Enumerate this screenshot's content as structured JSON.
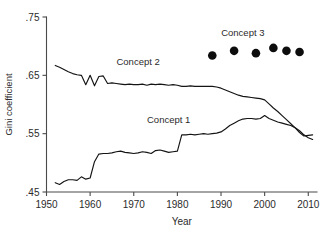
{
  "chart_data": {
    "type": "line",
    "title": "",
    "xlabel": "Year",
    "ylabel": "Gini coefficient",
    "xlim": [
      1950,
      2012
    ],
    "ylim": [
      0.45,
      0.75
    ],
    "grid": false,
    "legend": "inline-annotations",
    "xticks": [
      1950,
      1960,
      1970,
      1980,
      1990,
      2000,
      2010
    ],
    "xtick_labels": [
      "1950",
      "1960",
      "1970",
      "1980",
      "1990",
      "2000",
      "2010"
    ],
    "yticks": [
      0.45,
      0.55,
      0.65,
      0.75
    ],
    "ytick_labels": [
      ".45",
      ".55",
      ".65",
      ".75"
    ],
    "series": [
      {
        "name": "Concept 1",
        "label": "Concept 1",
        "style": "line",
        "color": "#141414",
        "label_x": 1978,
        "label_y": 0.568,
        "x": [
          1952,
          1953,
          1954,
          1955,
          1956,
          1957,
          1958,
          1959,
          1960,
          1961,
          1962,
          1963,
          1964,
          1965,
          1966,
          1967,
          1968,
          1969,
          1970,
          1971,
          1972,
          1973,
          1974,
          1975,
          1976,
          1977,
          1978,
          1979,
          1980,
          1981,
          1982,
          1983,
          1984,
          1985,
          1986,
          1987,
          1988,
          1989,
          1990,
          1991,
          1992,
          1993,
          1994,
          1995,
          1996,
          1997,
          1998,
          1999,
          2000,
          2001,
          2002,
          2003,
          2004,
          2005,
          2006,
          2007,
          2008,
          2009,
          2010,
          2011
        ],
        "y": [
          0.466,
          0.463,
          0.468,
          0.471,
          0.471,
          0.47,
          0.476,
          0.472,
          0.474,
          0.502,
          0.515,
          0.516,
          0.516,
          0.517,
          0.519,
          0.52,
          0.518,
          0.517,
          0.516,
          0.517,
          0.519,
          0.518,
          0.516,
          0.521,
          0.522,
          0.52,
          0.518,
          0.519,
          0.52,
          0.548,
          0.548,
          0.549,
          0.548,
          0.549,
          0.55,
          0.549,
          0.55,
          0.551,
          0.553,
          0.558,
          0.564,
          0.568,
          0.572,
          0.575,
          0.576,
          0.576,
          0.575,
          0.576,
          0.581,
          0.576,
          0.573,
          0.57,
          0.568,
          0.566,
          0.564,
          0.56,
          0.555,
          0.548,
          0.543,
          0.54
        ]
      },
      {
        "name": "Concept 2",
        "label": "Concept 2",
        "style": "line",
        "color": "#141414",
        "label_x": 1971,
        "label_y": 0.667,
        "x": [
          1952,
          1953,
          1954,
          1955,
          1956,
          1957,
          1958,
          1959,
          1960,
          1961,
          1962,
          1963,
          1964,
          1965,
          1966,
          1967,
          1968,
          1969,
          1970,
          1971,
          1972,
          1973,
          1974,
          1975,
          1976,
          1977,
          1978,
          1979,
          1980,
          1981,
          1982,
          1983,
          1984,
          1985,
          1986,
          1987,
          1988,
          1989,
          1990,
          1991,
          1992,
          1993,
          1994,
          1995,
          1996,
          1997,
          1998,
          1999,
          2000,
          2001,
          2002,
          2003,
          2004,
          2005,
          2006,
          2007,
          2008,
          2009,
          2010,
          2011
        ],
        "y": [
          0.667,
          0.664,
          0.66,
          0.656,
          0.653,
          0.651,
          0.65,
          0.634,
          0.65,
          0.632,
          0.648,
          0.649,
          0.636,
          0.637,
          0.636,
          0.635,
          0.634,
          0.635,
          0.634,
          0.634,
          0.635,
          0.633,
          0.635,
          0.634,
          0.635,
          0.634,
          0.633,
          0.634,
          0.633,
          0.631,
          0.631,
          0.632,
          0.631,
          0.631,
          0.631,
          0.631,
          0.631,
          0.63,
          0.628,
          0.625,
          0.622,
          0.619,
          0.616,
          0.614,
          0.613,
          0.612,
          0.611,
          0.61,
          0.608,
          0.601,
          0.594,
          0.588,
          0.581,
          0.574,
          0.567,
          0.56,
          0.552,
          0.546,
          0.547,
          0.548
        ]
      },
      {
        "name": "Concept 3",
        "label": "Concept 3",
        "style": "markers",
        "color": "#0d0d0d",
        "label_x": 1995,
        "label_y": 0.718,
        "x": [
          1988,
          1993,
          1998,
          2002,
          2005,
          2008
        ],
        "y": [
          0.684,
          0.692,
          0.688,
          0.697,
          0.692,
          0.69
        ]
      }
    ]
  },
  "axes": {
    "x_title": "Year",
    "y_title": "Gini coefficient"
  }
}
